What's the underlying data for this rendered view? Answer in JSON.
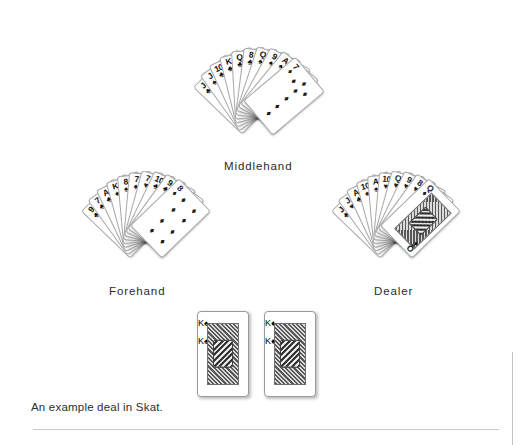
{
  "figure": {
    "caption": "An example deal in Skat.",
    "game": "Skat",
    "background_color": "#ffffff",
    "rule_color": "#c8c8c8"
  },
  "hands": [
    {
      "id": "middlehand",
      "label": "Middlehand",
      "card_count": 10,
      "cards": [
        {
          "rank": "J",
          "suit": "clubs",
          "symbol": "♣",
          "color": "#111111"
        },
        {
          "rank": "J",
          "suit": "spades",
          "symbol": "♠",
          "color": "#111111"
        },
        {
          "rank": "10",
          "suit": "clubs",
          "symbol": "♣",
          "color": "#111111"
        },
        {
          "rank": "K",
          "suit": "clubs",
          "symbol": "♣",
          "color": "#111111"
        },
        {
          "rank": "Q",
          "suit": "clubs",
          "symbol": "♣",
          "color": "#111111"
        },
        {
          "rank": "8",
          "suit": "clubs",
          "symbol": "♣",
          "color": "#111111"
        },
        {
          "rank": "Q",
          "suit": "spades",
          "symbol": "♠",
          "color": "#111111"
        },
        {
          "rank": "9",
          "suit": "spades",
          "symbol": "♠",
          "color": "#111111"
        },
        {
          "rank": "A",
          "suit": "spades",
          "symbol": "♠",
          "color": "#111111"
        },
        {
          "rank": "7",
          "suit": "diamonds",
          "symbol": "♦",
          "color": "#1b1b1b"
        }
      ]
    },
    {
      "id": "forehand",
      "label": "Forehand",
      "card_count": 10,
      "cards": [
        {
          "rank": "9",
          "suit": "clubs",
          "symbol": "♣",
          "color": "#111111"
        },
        {
          "rank": "7",
          "suit": "clubs",
          "symbol": "♣",
          "color": "#111111"
        },
        {
          "rank": "A",
          "suit": "clubs",
          "symbol": "♣",
          "color": "#111111"
        },
        {
          "rank": "K",
          "suit": "spades",
          "symbol": "♠",
          "color": "#111111"
        },
        {
          "rank": "8",
          "suit": "spades",
          "symbol": "♠",
          "color": "#111111"
        },
        {
          "rank": "7",
          "suit": "spades",
          "symbol": "♠",
          "color": "#111111"
        },
        {
          "rank": "7",
          "suit": "hearts",
          "symbol": "♥",
          "color": "#1b1b1b"
        },
        {
          "rank": "10",
          "suit": "clubs",
          "symbol": "♣",
          "color": "#111111"
        },
        {
          "rank": "9",
          "suit": "clubs",
          "symbol": "♣",
          "color": "#111111"
        },
        {
          "rank": "8",
          "suit": "diamonds",
          "symbol": "♦",
          "color": "#1b1b1b"
        }
      ]
    },
    {
      "id": "dealer",
      "label": "Dealer",
      "card_count": 10,
      "cards": [
        {
          "rank": "J",
          "suit": "clubs",
          "symbol": "♣",
          "color": "#111111"
        },
        {
          "rank": "J",
          "suit": "hearts",
          "symbol": "♥",
          "color": "#1b1b1b"
        },
        {
          "rank": "A",
          "suit": "clubs",
          "symbol": "♣",
          "color": "#111111"
        },
        {
          "rank": "10",
          "suit": "spades",
          "symbol": "♠",
          "color": "#111111"
        },
        {
          "rank": "A",
          "suit": "spades",
          "symbol": "♠",
          "color": "#111111"
        },
        {
          "rank": "10",
          "suit": "hearts",
          "symbol": "♥",
          "color": "#1b1b1b"
        },
        {
          "rank": "Q",
          "suit": "hearts",
          "symbol": "♥",
          "color": "#1b1b1b"
        },
        {
          "rank": "9",
          "suit": "hearts",
          "symbol": "♥",
          "color": "#1b1b1b"
        },
        {
          "rank": "8",
          "suit": "hearts",
          "symbol": "♥",
          "color": "#1b1b1b"
        },
        {
          "rank": "Q",
          "suit": "diamonds",
          "symbol": "♦",
          "color": "#1b1b1b",
          "court": true
        }
      ]
    }
  ],
  "skat": {
    "label": "",
    "card_count": 2,
    "cards": [
      {
        "rank": "K",
        "suit": "spades",
        "symbol": "♠",
        "color": "#111111",
        "court": true
      },
      {
        "rank": "K",
        "suit": "diamonds",
        "symbol": "♦",
        "color": "#1b1b1b",
        "court": true
      }
    ]
  }
}
